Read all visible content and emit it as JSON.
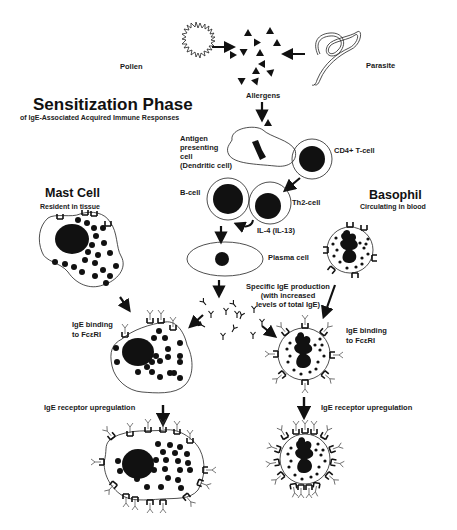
{
  "diagram": {
    "title": "Sensitization Phase",
    "subtitle": "of IgE-Associated Acquired Immune Responses",
    "sources": {
      "pollen": "Pollen",
      "parasite": "Parasite",
      "allergens": "Allergens"
    },
    "cells": {
      "apc_line1": "Antigen",
      "apc_line2": "presenting",
      "apc_line3": "cell",
      "apc_line4": "(Dendritic cell)",
      "cd4": "CD4+ T-cell",
      "bcell": "B-cell",
      "th2": "Th2-cell",
      "il4": "IL-4 (IL-13)",
      "plasma": "Plasma cell"
    },
    "ige_production": {
      "line1": "Specific IgE production",
      "line2": "(with increased",
      "line3": "levels of total IgE)"
    },
    "mast_cell": {
      "title": "Mast Cell",
      "subtitle": "Resident in tissue",
      "binding_line1": "IgE binding",
      "binding_line2": "to FcεRI",
      "upregulation": "IgE receptor upregulation"
    },
    "basophil": {
      "title": "Basophil",
      "subtitle": "Circulating in blood",
      "binding_line1": "IgE binding",
      "binding_line2": "to FcεRI",
      "upregulation": "IgE receptor upregulation"
    },
    "colors": {
      "ink": "#111111",
      "background": "#ffffff"
    }
  }
}
